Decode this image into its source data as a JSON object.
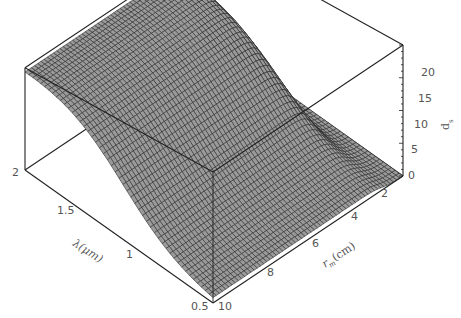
{
  "chart_data": {
    "type": "surface3d",
    "title": "",
    "x_axis": {
      "label": "λ(μm)",
      "ticks": [
        "2",
        "1.5",
        "1",
        "0.5"
      ],
      "range": [
        0.5,
        2
      ]
    },
    "y_axis": {
      "label": "r_m(cm)",
      "ticks": [
        "2",
        "4",
        "6",
        "8",
        "10"
      ],
      "range": [
        1,
        10
      ]
    },
    "z_axis": {
      "label": "d_s",
      "ticks": [
        "0",
        "5",
        "10",
        "15",
        "20"
      ],
      "range": [
        0,
        20
      ]
    },
    "grid": true,
    "legend": null,
    "sample_points": [
      {
        "lambda": 2.0,
        "r_m": 10,
        "d": 20
      },
      {
        "lambda": 2.0,
        "r_m": 3,
        "d": 20
      },
      {
        "lambda": 2.0,
        "r_m": 1.5,
        "d": 2
      },
      {
        "lambda": 1.5,
        "r_m": 10,
        "d": 14
      },
      {
        "lambda": 1.0,
        "r_m": 10,
        "d": 3
      },
      {
        "lambda": 0.5,
        "r_m": 10,
        "d": 0
      },
      {
        "lambda": 0.5,
        "r_m": 2,
        "d": 0
      }
    ]
  },
  "labels": {
    "z_ticks": [
      "20",
      "15",
      "10",
      "5",
      "0"
    ],
    "z_label": "d",
    "z_label_sub": "s",
    "lambda_ticks": [
      "2",
      "1.5",
      "1",
      "0.5"
    ],
    "lambda_label": "λ(μm)",
    "rm_ticks": [
      "10",
      "8",
      "6",
      "4",
      "2"
    ],
    "rm_label_main": "r",
    "rm_label_sub": "m",
    "rm_label_unit": "(cm)"
  }
}
